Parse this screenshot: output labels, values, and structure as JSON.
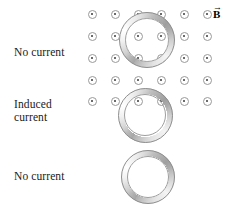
{
  "figure": {
    "width": 230,
    "height": 209,
    "background_color": "#ffffff"
  },
  "field": {
    "symbol_label": "B",
    "vector_accent": "→",
    "direction_description": "out-of-page",
    "dot_glyph_name": "field-out-of-page-dot",
    "dot_color": "#3a3a3a",
    "dot_ring_color": "#9a9a9a",
    "columns": 6,
    "rows": 5,
    "x_positions": [
      92,
      115,
      138,
      161,
      184,
      207
    ],
    "y_positions": [
      14,
      36,
      58,
      80,
      101
    ],
    "dot_diameter": 9
  },
  "rings": [
    {
      "name": "ring-top",
      "state_label": "No current",
      "center_x": 147,
      "center_y": 40,
      "diameter": 56,
      "color": "#b4b4b4"
    },
    {
      "name": "ring-middle",
      "state_label": "Induced current",
      "center_x": 145,
      "center_y": 115,
      "diameter": 55,
      "color": "#b4b4b4"
    },
    {
      "name": "ring-bottom",
      "state_label": "No current",
      "center_x": 148,
      "center_y": 177,
      "diameter": 54,
      "color": "#b4b4b4"
    }
  ],
  "labels": {
    "top": "No current",
    "middle": "Induced\ncurrent",
    "bottom": "No current"
  }
}
